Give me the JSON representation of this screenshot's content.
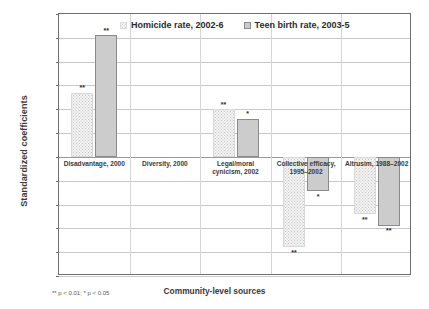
{
  "chart_data": {
    "type": "bar",
    "title": "",
    "xlabel": "Community-level sources",
    "ylabel": "Standardized coefficients",
    "ylim": [
      -0.5,
      0.6
    ],
    "ytick_step": 0.1,
    "grid": true,
    "legend_position": "top-center",
    "categories": [
      "Disadvantage, 2000",
      "Diversity, 2000",
      "Legal/moral\ncynicism, 2002",
      "Collective efficacy,\n1995–2002",
      "Altrusim, 1988–2002"
    ],
    "series": [
      {
        "name": "Homicide rate, 2002-6",
        "values": [
          0.27,
          0.0,
          0.2,
          -0.38,
          -0.24
        ],
        "significance": [
          "**",
          "",
          "**",
          "**",
          "**"
        ]
      },
      {
        "name": "Teen birth rate, 2003-5",
        "values": [
          0.51,
          0.0,
          0.16,
          -0.145,
          -0.29
        ],
        "significance": [
          "**",
          "",
          "*",
          "*",
          "**"
        ]
      }
    ],
    "ytick_labels": [
      "0.60",
      "0.50",
      "0.40",
      "0.30",
      "0.20",
      "0.10",
      "0.00",
      "-0.10",
      "-0.20",
      "-0.30",
      "-0.40",
      "-0.50"
    ],
    "footnote": "** p < 0.01; * p < 0.05",
    "colors": {
      "series1_fill": "#f2f2f2",
      "series1_pattern": "#c8c8c8",
      "series2_fill": "#cccccc",
      "axis": "#6e6e6e",
      "grid": "#c9c9c9",
      "text": "#2b2b2b"
    }
  },
  "legend": {
    "items": [
      {
        "label": "Homicide rate, 2002-6"
      },
      {
        "label": "Teen birth rate, 2003-5"
      }
    ]
  },
  "axes": {
    "y_title": "Standardized coefficients",
    "x_title": "Community-level sources"
  },
  "footnote": {
    "text": "** p < 0.01; * p < 0.05"
  }
}
